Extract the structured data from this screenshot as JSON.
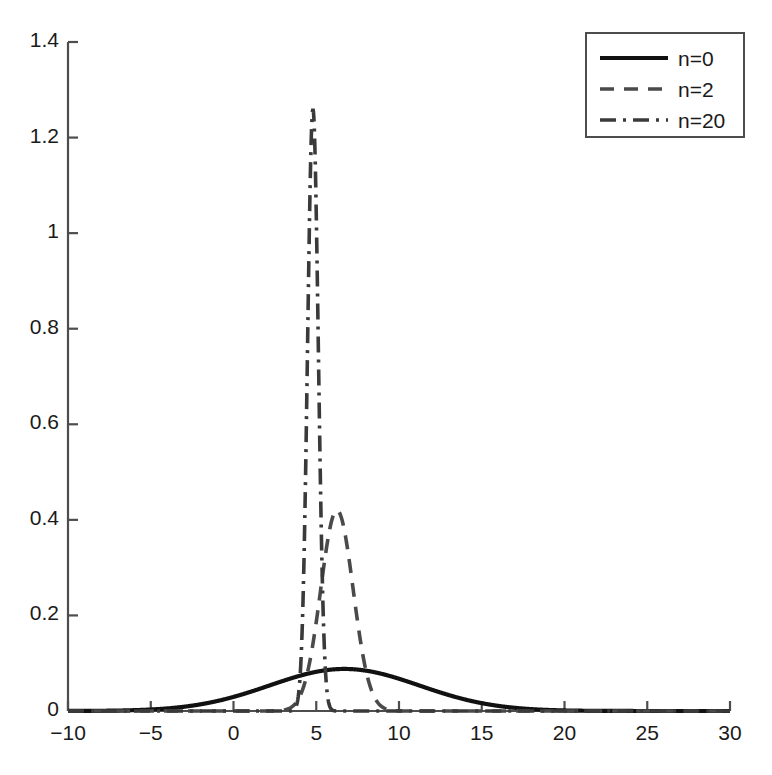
{
  "chart_data": {
    "type": "line",
    "title": "",
    "xlabel": "",
    "ylabel": "",
    "xlim": [
      -10,
      30
    ],
    "ylim": [
      0,
      1.4
    ],
    "xticks": [
      -10,
      -5,
      0,
      5,
      10,
      15,
      20,
      25,
      30
    ],
    "xtick_labels": [
      "−10",
      "−5",
      "0",
      "5",
      "10",
      "15",
      "20",
      "25",
      "30"
    ],
    "yticks": [
      0,
      0.2,
      0.4,
      0.6,
      0.8,
      1.0,
      1.2,
      1.4
    ],
    "ytick_labels": [
      "0",
      "0.2",
      "0.4",
      "0.6",
      "0.8",
      "1",
      "1.2",
      "1.4"
    ],
    "grid": false,
    "legend_position": "upper right",
    "line_color": "#1a1a1a",
    "axis_color": "#4d4d4d",
    "series": [
      {
        "name": "n=0",
        "label": "n=0",
        "linestyle": "solid",
        "dasharray": "",
        "linewidth": 4.2,
        "color": "#111111",
        "peak_x": 6.7,
        "peak_y": 0.088,
        "sigma": 4.53,
        "amplitude": 0.088
      },
      {
        "name": "n=2",
        "label": "n=2",
        "linestyle": "dashed",
        "dasharray": "14,10",
        "linewidth": 3.6,
        "color": "#4a4a4a",
        "peak_x": 6.25,
        "peak_y": 0.42,
        "sigma": 0.98,
        "amplitude": 0.42
      },
      {
        "name": "n=20",
        "label": "n=20",
        "linestyle": "dashdot",
        "dasharray": "16,7,3,7",
        "linewidth": 3.6,
        "color": "#3a3a3a",
        "peak_x": 4.8,
        "peak_y": 1.26,
        "sigma": 0.325,
        "amplitude": 1.26
      }
    ],
    "sampled_points": {
      "x": [
        -10,
        -9,
        -8,
        -7,
        -6,
        -5,
        -4,
        -3,
        -2,
        -1,
        0,
        1,
        2,
        3,
        3.5,
        4,
        4.3,
        4.6,
        4.8,
        5,
        5.3,
        5.6,
        6,
        6.3,
        6.7,
        7,
        7.5,
        8,
        9,
        10,
        11,
        12,
        13,
        14,
        15,
        16,
        17,
        18,
        19,
        20,
        22,
        24,
        26,
        28,
        30
      ],
      "n0": [
        0.0002,
        0.0005,
        0.0011,
        0.0023,
        0.0044,
        0.0079,
        0.0134,
        0.0216,
        0.0329,
        0.0475,
        0.0644,
        0.0813,
        0.0955,
        0.1044,
        0.1065,
        0.1074,
        0.1074,
        0.1072,
        0.1069,
        0.1065,
        0.1058,
        0.1049,
        0.1035,
        0.1023,
        0.1005,
        0.0991,
        0.0962,
        0.0929,
        0.0848,
        0.0752,
        0.0647,
        0.0539,
        0.0434,
        0.0337,
        0.0252,
        0.0182,
        0.0126,
        0.0084,
        0.0054,
        0.0033,
        0.0011,
        0.0003,
        0.0001,
        0.0,
        0.0
      ],
      "n2": [
        0.0,
        0.0,
        0.0,
        0.0,
        0.0,
        0.0,
        0.0,
        0.0,
        0.0,
        0.0,
        0.0,
        0.0,
        0.0,
        0.0005,
        0.0047,
        0.0241,
        0.0497,
        0.0904,
        0.1273,
        0.1704,
        0.2466,
        0.3165,
        0.3856,
        0.4136,
        0.4199,
        0.4106,
        0.3751,
        0.3165,
        0.1704,
        0.0664,
        0.0186,
        0.0037,
        0.0005,
        0.0,
        0.0,
        0.0,
        0.0,
        0.0,
        0.0,
        0.0,
        0.0,
        0.0,
        0.0,
        0.0,
        0.0
      ],
      "n20": [
        0.0,
        0.0,
        0.0,
        0.0,
        0.0,
        0.0,
        0.0,
        0.0,
        0.0,
        0.0,
        0.0,
        0.0,
        0.0,
        0.0,
        0.0003,
        0.0209,
        0.1617,
        0.5465,
        1.0067,
        1.2269,
        0.8113,
        0.2596,
        0.0168,
        0.0013,
        0.0,
        0.0,
        0.0,
        0.0,
        0.0,
        0.0,
        0.0,
        0.0,
        0.0,
        0.0,
        0.0,
        0.0,
        0.0,
        0.0,
        0.0,
        0.0,
        0.0,
        0.0,
        0.0,
        0.0,
        0.0
      ]
    }
  },
  "legend": {
    "entries": [
      {
        "label": "n=0"
      },
      {
        "label": "n=2"
      },
      {
        "label": "n=20"
      }
    ]
  }
}
